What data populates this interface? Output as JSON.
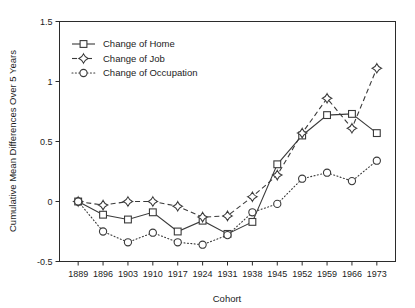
{
  "chart_data": {
    "type": "line",
    "title": "",
    "xlabel": "Cohort",
    "ylabel": "Cumulative Mean Differences Over 5 Years",
    "categories": [
      "1889",
      "1896",
      "1903",
      "1910",
      "1917",
      "1924",
      "1931",
      "1938",
      "1945",
      "1952",
      "1959",
      "1966",
      "1973"
    ],
    "x": [
      1889,
      1896,
      1903,
      1910,
      1917,
      1924,
      1931,
      1938,
      1945,
      1952,
      1959,
      1966,
      1973
    ],
    "xlim": [
      1885.5,
      1976.5
    ],
    "ylim": [
      -0.5,
      1.5
    ],
    "yticks": [
      -0.5,
      0,
      0.5,
      1,
      1.5
    ],
    "ytick_labels": [
      "-0.5",
      "0",
      "0.5",
      "1",
      "1.5"
    ],
    "xtick_labels": [
      "1889",
      "1896",
      "1903",
      "1910",
      "1917",
      "1924",
      "1931",
      "1938",
      "1945",
      "1952",
      "1959",
      "1966",
      "1973"
    ],
    "grid": false,
    "legend_position": "upper left",
    "series": [
      {
        "name": "Change of Home",
        "marker": "square",
        "linestyle": "solid",
        "values": [
          0.0,
          -0.11,
          -0.15,
          -0.09,
          -0.25,
          -0.16,
          -0.27,
          -0.17,
          0.31,
          0.55,
          0.72,
          0.73,
          0.57
        ]
      },
      {
        "name": "Change of Job",
        "marker": "diamond",
        "linestyle": "dashed",
        "values": [
          0.0,
          -0.03,
          0.0,
          0.0,
          -0.04,
          -0.13,
          -0.12,
          0.04,
          0.22,
          0.57,
          0.86,
          0.61,
          1.11
        ]
      },
      {
        "name": "Change of Occupation",
        "marker": "circle",
        "linestyle": "dotted",
        "values": [
          0.0,
          -0.25,
          -0.34,
          -0.26,
          -0.34,
          -0.36,
          -0.28,
          -0.09,
          -0.02,
          0.19,
          0.24,
          0.17,
          0.34
        ]
      }
    ]
  },
  "legend": {
    "items": [
      {
        "label": "Change of Home"
      },
      {
        "label": "Change of Job"
      },
      {
        "label": "Change of Occupation"
      }
    ]
  },
  "axes": {
    "x_title": "Cohort",
    "y_title": "Cumulative Mean Differences Over 5 Years"
  }
}
